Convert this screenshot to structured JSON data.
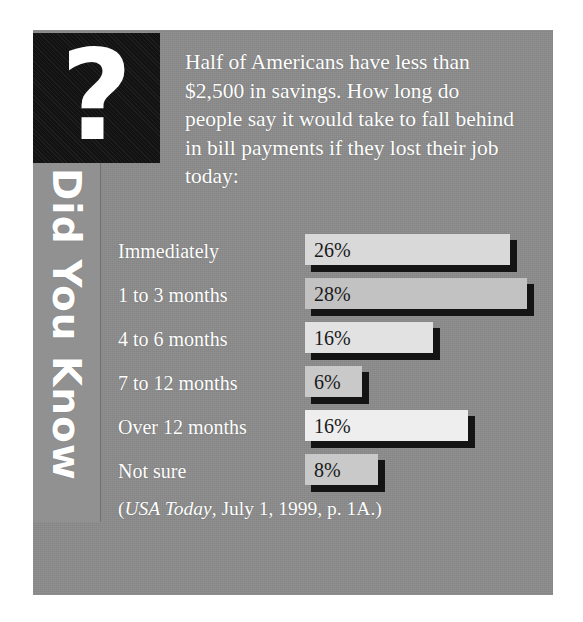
{
  "badge": {
    "icon": "question-mark-icon",
    "glyph": "?",
    "vertical_label": "Did You Know"
  },
  "intro": {
    "text": "Half of Americans have less than $2,500 in savings. How long do people say it would take to fall behind in bill payments if they lost their job today:"
  },
  "source": {
    "open_paren": "(",
    "publication": "USA Today",
    "rest": ", July 1, 1999, p. 1A.)"
  },
  "colors": {
    "panel_gray": "#8c8c8c",
    "strip_gray": "#919191",
    "badge_black": "#121212",
    "shadow_black": "#141414",
    "label_white": "#ffffff",
    "value_black": "#1a1a1a"
  },
  "chart_data": {
    "type": "bar",
    "title": "Half of Americans have less than $2,500 in savings. How long do people say it would take to fall behind in bill payments if they lost their job today:",
    "orientation": "horizontal",
    "xlabel": "",
    "ylabel": "",
    "xlim": [
      0,
      28
    ],
    "grid": false,
    "legend": false,
    "unit": "%",
    "categories": [
      "Immediately",
      "1 to 3 months",
      "4 to 6 months",
      "7 to 12 months",
      "Over 12 months",
      "Not sure"
    ],
    "values": [
      26,
      28,
      16,
      6,
      16,
      8
    ],
    "value_labels": [
      "26%",
      "28%",
      "16%",
      "6%",
      "16%",
      "8%"
    ],
    "bar_fills": [
      "#d9d9d9",
      "#c2c2c2",
      "#e2e2e2",
      "#c9c9c9",
      "#eeeeee",
      "#c9c9c9"
    ],
    "bar_pixel_widths": [
      205,
      222,
      128,
      57,
      163,
      73
    ]
  }
}
